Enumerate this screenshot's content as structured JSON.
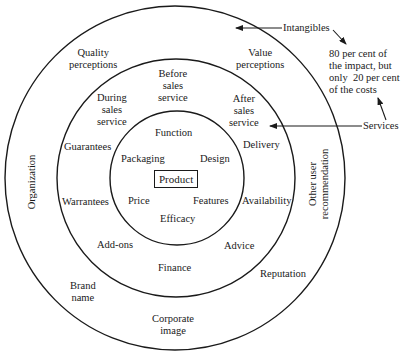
{
  "diagram": {
    "rings": [
      {
        "name": "core",
        "cx": 177,
        "cy": 178,
        "r": 67
      },
      {
        "name": "services",
        "cx": 176,
        "cy": 178,
        "r": 119
      },
      {
        "name": "intangibles",
        "cx": 175,
        "cy": 178,
        "r": 171
      }
    ],
    "center": {
      "label": "Product"
    },
    "core_items": {
      "function": "Function",
      "packaging": "Packaging",
      "design": "Design",
      "price": "Price",
      "features": "Features",
      "efficacy": "Efficacy"
    },
    "service_items": {
      "before_sales": "Before\nsales\nservice",
      "during_sales": "During\nsales\nservice",
      "after_sales": "After\nsales\nservice",
      "guarantees": "Guarantees",
      "delivery": "Delivery",
      "warrantees": "Warrantees",
      "availability": "Availability",
      "add_ons": "Add-ons",
      "advice": "Advice",
      "finance": "Finance"
    },
    "intangible_items": {
      "quality_perceptions": "Quality\nperceptions",
      "value_perceptions": "Value\nperceptions",
      "organization": "Organization",
      "other_user_recommendation": "Other user\nrecommendation",
      "brand_name": "Brand\nname",
      "reputation": "Reputation",
      "corporate_image": "Corporate\nimage"
    },
    "annotations": {
      "intangibles": "Intangibles",
      "services": "Services",
      "note": "80 per cent of\nthe impact, but\nonly  20 per cent\nof the costs"
    },
    "colors": {
      "line": "#1a1a1a",
      "background": "#ffffff"
    }
  }
}
